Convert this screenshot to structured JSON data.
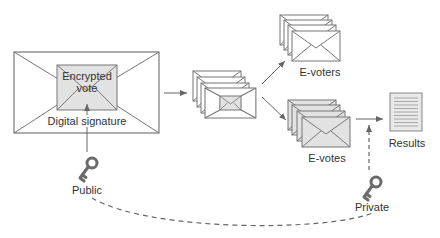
{
  "diagram": {
    "main_envelope": {
      "inner_label_line1": "Encrypted",
      "inner_label_line2": "vote",
      "signature_label": "Digital signature"
    },
    "stacks": {
      "mixed": {
        "count": 4
      },
      "voters": {
        "count": 4,
        "label": "E-voters"
      },
      "votes": {
        "count": 4,
        "label": "E-votes"
      }
    },
    "results": {
      "label": "Results"
    },
    "keys": {
      "public": {
        "label": "Public",
        "icon": "key-icon"
      },
      "private": {
        "label": "Private",
        "icon": "key-icon"
      }
    },
    "colors": {
      "stroke": "#777777",
      "gray_fill": "#e2e2e2",
      "white_fill": "#ffffff",
      "key": "#6a6a6a",
      "text": "#333333"
    }
  }
}
